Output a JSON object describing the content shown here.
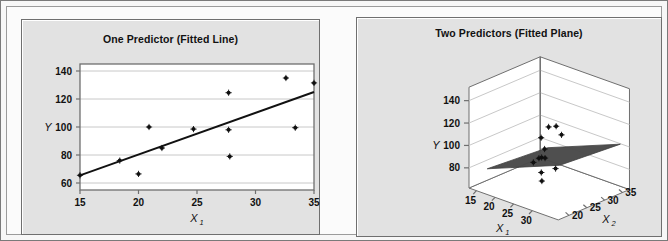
{
  "figure": {
    "background_color": "#f7f7f7",
    "panel_background_color": "#e2e2e2",
    "plot_background_color": "#ffffff",
    "gridline_color": "#c8c8c8",
    "marker_color": "#111111",
    "fit_line_color": "#111111",
    "plane_color": "#4a4a4a"
  },
  "panels": {
    "left": {
      "title": "One Predictor (Fitted Line)",
      "y_axis_label": "Y",
      "x_axis_label": "X",
      "x_axis_label_sub": "1"
    },
    "right": {
      "title": "Two Predictors (Fitted Plane)",
      "y_axis_label": "Y",
      "x1_axis_label": "X",
      "x1_axis_label_sub": "1",
      "x2_axis_label": "X",
      "x2_axis_label_sub": "2"
    }
  },
  "chart_data": [
    {
      "type": "scatter",
      "title": "One Predictor (Fitted Line)",
      "xlabel": "X1",
      "ylabel": "Y",
      "xlim": [
        15,
        35
      ],
      "ylim": [
        55,
        145
      ],
      "xticks": [
        15,
        20,
        25,
        30,
        35
      ],
      "yticks": [
        60,
        80,
        100,
        120,
        140
      ],
      "grid": true,
      "legend": "none",
      "x": [
        15.0,
        18.4,
        20.0,
        20.9,
        22.0,
        24.7,
        27.7,
        27.7,
        27.8,
        32.6,
        33.4,
        35.0
      ],
      "y": [
        65.5,
        76.0,
        66.5,
        100.0,
        85.0,
        98.5,
        124.5,
        98.0,
        79.0,
        135.0,
        99.5,
        131.5
      ],
      "fit_line": {
        "label": "Fitted Line",
        "x": [
          15,
          35
        ],
        "y": [
          65.5,
          125.0
        ]
      }
    },
    {
      "type": "scatter",
      "title": "Two Predictors (Fitted Plane)",
      "projection": "3d",
      "xlabel": "X1",
      "ylabel": "X2",
      "zlabel": "Y",
      "x1ticks": [
        15,
        20,
        25,
        30
      ],
      "x2ticks": [
        20,
        25,
        30,
        35
      ],
      "zticks": [
        80,
        100,
        120,
        140
      ],
      "zlim": [
        70,
        150
      ],
      "grid": true,
      "legend": "none",
      "points": [
        {
          "x1": 15.0,
          "x2": 33.0,
          "y": 65.5
        },
        {
          "x1": 18.4,
          "x2": 31.0,
          "y": 76.0
        },
        {
          "x1": 20.0,
          "x2": 30.0,
          "y": 66.5
        },
        {
          "x1": 20.9,
          "x2": 29.0,
          "y": 100.0
        },
        {
          "x1": 22.0,
          "x2": 28.0,
          "y": 85.0
        },
        {
          "x1": 24.7,
          "x2": 26.0,
          "y": 98.5
        },
        {
          "x1": 27.7,
          "x2": 24.0,
          "y": 124.5
        },
        {
          "x1": 27.7,
          "x2": 23.0,
          "y": 98.0
        },
        {
          "x1": 27.8,
          "x2": 22.0,
          "y": 79.0
        },
        {
          "x1": 32.6,
          "x2": 21.0,
          "y": 135.0
        },
        {
          "x1": 33.4,
          "x2": 20.0,
          "y": 99.5
        },
        {
          "x1": 35.0,
          "x2": 20.0,
          "y": 131.5
        }
      ],
      "fitted_plane": {
        "label": "Fitted Plane",
        "color": "#4a4a4a"
      }
    }
  ]
}
